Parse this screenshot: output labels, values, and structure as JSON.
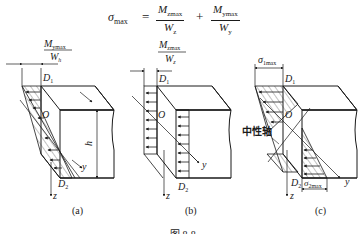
{
  "formula": {
    "lhs_symbol": "σ",
    "lhs_sub": "max",
    "equals": "=",
    "plus": "+",
    "term1_num": "M",
    "term1_num_sub": "zmax",
    "term1_den": "W",
    "term1_den_sub": "z",
    "term2_num": "M",
    "term2_num_sub": "ymax",
    "term2_den": "W",
    "term2_den_sub": "y"
  },
  "panels": [
    {
      "id": "a",
      "caption": "(a)",
      "dim_label_num": "M",
      "dim_label_num_sub": "ymax",
      "dim_label_den": "W",
      "dim_label_den_sub": "h",
      "top_point": "D",
      "top_point_sub": "1",
      "bottom_point": "D",
      "bottom_point_sub": "2",
      "origin": "O",
      "height_label": "h",
      "axis_y": "y",
      "axis_z": "z"
    },
    {
      "id": "b",
      "caption": "(b)",
      "dim_label_num": "M",
      "dim_label_num_sub": "zmax",
      "dim_label_den": "W",
      "dim_label_den_sub": "z",
      "top_point": "D",
      "top_point_sub": "1",
      "bottom_point": "D",
      "bottom_point_sub": "2",
      "origin": "O",
      "axis_y": "y",
      "axis_z": "z"
    },
    {
      "id": "c",
      "caption": "(c)",
      "top_stress": "σ",
      "top_stress_sub": "1max",
      "bottom_stress": "σ",
      "bottom_stress_sub": "2max",
      "top_point": "D",
      "top_point_sub": "1",
      "bottom_point": "D",
      "bottom_point_sub": "2",
      "origin": "O",
      "neutral_axis_label": "中性轴",
      "axis_y": "y",
      "axis_z": "z"
    }
  ],
  "figure_caption": "图 8-8"
}
